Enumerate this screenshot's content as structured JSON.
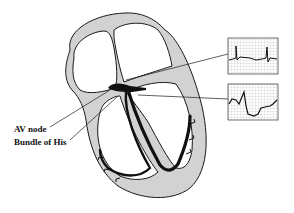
{
  "diagram": {
    "labels": {
      "av_node": "AV node",
      "bundle_of_his": "Bundle of His"
    },
    "ecg_panels": [
      {
        "name": "upper-ecg",
        "description": "surface ECG strip with two QRS spikes"
      },
      {
        "name": "lower-ecg",
        "description": "His bundle electrogram with large deflection"
      }
    ],
    "colors": {
      "wall_fill": "#d2d2d2",
      "outline": "#1a1a1a",
      "conduction": "#111111",
      "grid": "#9a9a9a",
      "background": "#ffffff"
    }
  }
}
